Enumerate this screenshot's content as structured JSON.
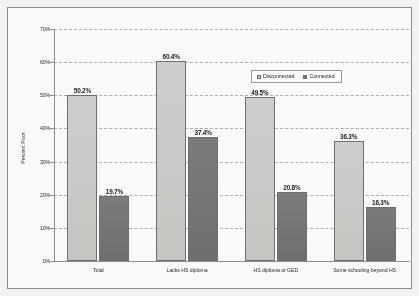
{
  "chart_data": {
    "type": "bar",
    "title": "",
    "subtitle": "",
    "xlabel": "",
    "ylabel": "Percent Poor",
    "ylim": [
      0,
      70
    ],
    "ytick_step": 10,
    "grid": true,
    "legend_position": "upper-right-inside",
    "value_label_suffix": "%",
    "categories": [
      "Total",
      "Lacks HS diploma",
      "HS diploma or GED",
      "Some schooling beyond HS"
    ],
    "series": [
      {
        "name": "Disconnected",
        "color": "#c9c9c7",
        "values": [
          50.2,
          60.4,
          49.5,
          36.3
        ],
        "value_labels": [
          "50.2%",
          "60.4%",
          "49.5%",
          "36.3%"
        ]
      },
      {
        "name": "Connected",
        "color": "#767674",
        "values": [
          19.7,
          37.4,
          20.8,
          16.3
        ],
        "value_labels": [
          "19.7%",
          "37.4%",
          "20.8%",
          "16.3%"
        ]
      }
    ],
    "ytick_labels": [
      "70%",
      "60%",
      "50%",
      "40%",
      "30%",
      "20%",
      "10%",
      "0%"
    ],
    "ytick_values": [
      70,
      60,
      50,
      40,
      30,
      20,
      10,
      0
    ]
  },
  "legend": {
    "entries": [
      {
        "label": "Disconnected",
        "color": "#c9c9c7"
      },
      {
        "label": "Connected",
        "color": "#767674"
      }
    ]
  },
  "colors": {
    "disconnected": "#c9c9c7",
    "connected": "#767674",
    "gridline": "#9aa2ad",
    "axis": "#8e8e8e",
    "text": "#2b2b2b",
    "page_background": "#f3f2f0",
    "plot_background": "#fbfbfa"
  }
}
